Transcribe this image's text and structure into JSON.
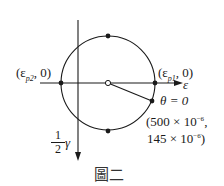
{
  "diagram": {
    "type": "mohr_circle_strain",
    "axes": {
      "x_label": "ε",
      "y_label_fraction": {
        "numerator": "1",
        "denominator": "2"
      },
      "y_label_symbol": "γ"
    },
    "points": {
      "left": {
        "label_open": "(ε",
        "label_sub": "p2",
        "label_close": ", 0)"
      },
      "right": {
        "label_open": "(ε",
        "label_sub": "p1",
        "label_close": ", 0)"
      },
      "theta_zero": {
        "angle_label": "θ = 0",
        "coord_line1": "(500 × 10",
        "coord_line1_exp": "−6",
        "coord_line1_end": ",",
        "coord_line2": "145 × 10",
        "coord_line2_exp": "−6",
        "coord_line2_end": ")"
      }
    },
    "caption": "圖二"
  },
  "colors": {
    "stroke": "#1a1a1a",
    "background": "#ffffff"
  }
}
